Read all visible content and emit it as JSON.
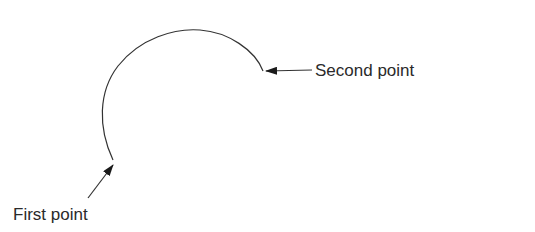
{
  "diagram": {
    "type": "arc-annotation",
    "labels": {
      "first_point": "First point",
      "second_point": "Second point"
    },
    "arc": {
      "start": [
        113,
        160
      ],
      "end": [
        263,
        71
      ],
      "direction": "counter-clockwise through top-left",
      "stroke": "#333333"
    },
    "arrows": [
      {
        "name": "first-point-arrow",
        "from": [
          88,
          198
        ],
        "to": [
          113,
          165
        ]
      },
      {
        "name": "second-point-arrow",
        "from": [
          312,
          70
        ],
        "to": [
          266,
          71
        ]
      }
    ],
    "colors": {
      "background": "#ffffff",
      "line": "#333333",
      "text": "#2a2a2a"
    }
  }
}
